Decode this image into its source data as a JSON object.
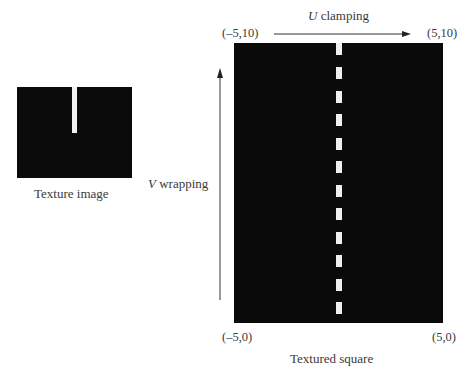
{
  "texture_image": {
    "caption": "Texture image",
    "background_color": "#0b0b0b",
    "slot_color": "#f2f2f2"
  },
  "textured_square": {
    "caption": "Textured square",
    "corners": {
      "top_left": "(–5,10)",
      "top_right": "(5,10)",
      "bottom_left": "(–5,0)",
      "bottom_right": "(5,0)"
    },
    "dash_count": 12
  },
  "axes": {
    "u_label_var": "U",
    "u_label_text": " clamping",
    "v_label_var": "V",
    "v_label_text": " wrapping"
  }
}
